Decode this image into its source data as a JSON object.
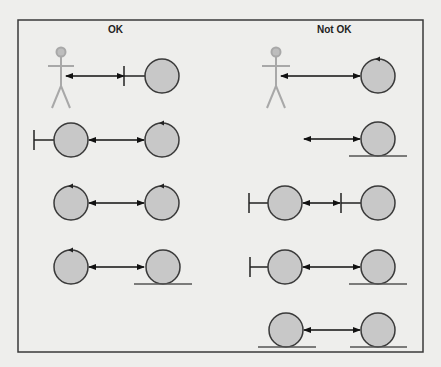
{
  "diagram": {
    "type": "robustness-analysis-rules",
    "colors": {
      "background": "#eeeeec",
      "frame": "#3a3a3a",
      "circle_fill": "#c8c8c8",
      "circle_stroke": "#3a3a3a",
      "actor": "#a8a8a8",
      "arrow": "#111111"
    },
    "columns": [
      {
        "heading": "OK",
        "rows": [
          {
            "from": "actor",
            "to": "boundary",
            "relation": "bidirectional"
          },
          {
            "from": "boundary",
            "to": "control",
            "relation": "bidirectional"
          },
          {
            "from": "control",
            "to": "control",
            "relation": "bidirectional"
          },
          {
            "from": "control",
            "to": "entity",
            "relation": "bidirectional"
          }
        ]
      },
      {
        "heading": "Not OK",
        "rows": [
          {
            "from": "actor",
            "to": "control",
            "relation": "bidirectional"
          },
          {
            "from": "none",
            "to": "entity",
            "relation": "bidirectional"
          },
          {
            "from": "boundary",
            "to": "boundary",
            "relation": "bidirectional"
          },
          {
            "from": "boundary",
            "to": "entity",
            "relation": "bidirectional"
          },
          {
            "from": "entity",
            "to": "entity",
            "relation": "bidirectional"
          }
        ]
      }
    ]
  }
}
